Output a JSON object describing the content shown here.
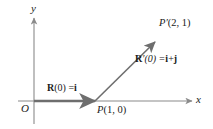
{
  "figure": {
    "background_color": "#ffffff",
    "axis_color": "#8a8a8a",
    "vector_color": "#6e6e6e",
    "text_color": "#1a1a1a"
  },
  "axes": {
    "y_label": "y",
    "x_label": "x",
    "origin_label": "O"
  },
  "points": [
    {
      "name": "P",
      "label": "P(1, 0)",
      "label_parts": {
        "italic": "P",
        "rest": "(1, 0)"
      },
      "coords": [
        1,
        0
      ]
    },
    {
      "name": "P-prime",
      "label": "P′(2, 1)",
      "label_parts": {
        "italic": "P′",
        "rest": "(2, 1)"
      },
      "coords": [
        2,
        1
      ]
    }
  ],
  "vectors": [
    {
      "name": "position-vector",
      "label": "R(0) = i",
      "label_parts": {
        "bold_r": "R",
        "args": "(0) =",
        "bold_i": "i"
      },
      "from": [
        0,
        0
      ],
      "to": [
        1,
        0
      ]
    },
    {
      "name": "velocity-vector",
      "label": "R′(0) = i + j",
      "label_parts": {
        "bold_r": "R",
        "args": "′(0) =",
        "bold_i": "i",
        "plus": "+",
        "bold_j": "j"
      },
      "from": [
        1,
        0
      ],
      "to": [
        2,
        1
      ]
    }
  ]
}
